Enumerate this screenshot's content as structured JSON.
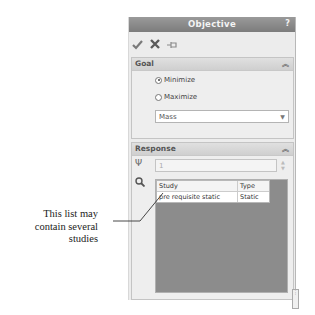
{
  "panel": {
    "title": "Objective",
    "help_label": "?",
    "toolbar": {
      "ok_icon": "checkmark-icon",
      "cancel_icon": "x-icon",
      "pin_icon": "pushpin-icon"
    }
  },
  "goal": {
    "header": "Goal",
    "collapse_icon": "double-chevron-up-icon",
    "options": [
      {
        "label": "Minimize",
        "selected": true
      },
      {
        "label": "Maximize",
        "selected": false
      }
    ],
    "quantity": {
      "selected": "Mass"
    }
  },
  "response": {
    "header": "Response",
    "collapse_icon": "double-chevron-up-icon",
    "tuning_fork_icon": "tuning-fork-icon",
    "spinbox_value": "1",
    "search_icon": "magnifier-icon",
    "table": {
      "columns": [
        "Study",
        "Type"
      ],
      "rows": [
        {
          "study": "pre requisite static",
          "type": "Static"
        }
      ]
    }
  },
  "annotation": {
    "text_lines": [
      "This list may",
      "contain several",
      "studies"
    ]
  },
  "colors": {
    "titlebar": "#8a8a8a",
    "panel_bg": "#ececec",
    "list_bg": "#8c8c8c"
  }
}
